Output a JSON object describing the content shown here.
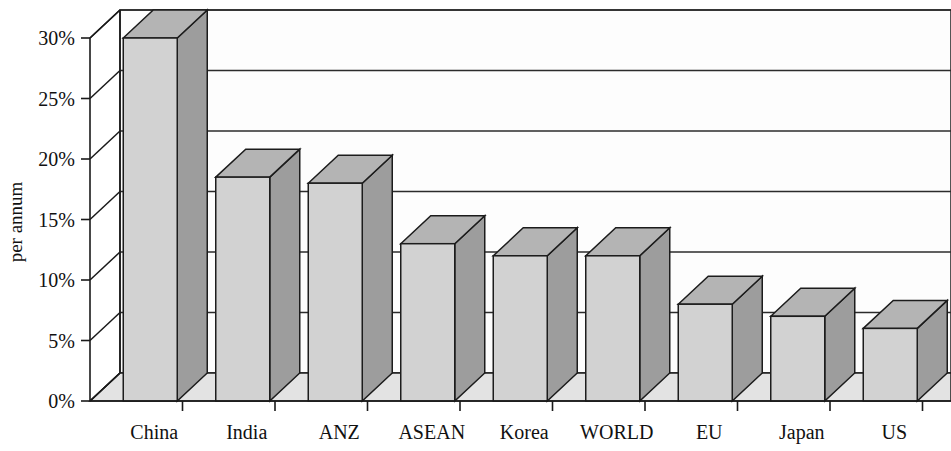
{
  "chart_data": {
    "type": "bar",
    "title": "",
    "subtitle": "",
    "xlabel": "",
    "ylabel": "per annum",
    "categories": [
      "China",
      "India",
      "ANZ",
      "ASEAN",
      "Korea",
      "WORLD",
      "EU",
      "Japan",
      "US"
    ],
    "values": [
      30,
      18.5,
      18,
      13,
      12,
      12,
      8,
      7,
      6
    ],
    "ytick_labels": [
      "0%",
      "5%",
      "10%",
      "15%",
      "20%",
      "25%",
      "30%"
    ],
    "ytick_values": [
      0,
      5,
      10,
      15,
      20,
      25,
      30
    ],
    "ylim": [
      0,
      30
    ],
    "grid": "horizontal",
    "legend": "none",
    "style": "3d-column",
    "colors": {
      "bar_front": "#d2d2d2",
      "bar_top": "#b4b4b4",
      "bar_side": "#9d9d9d",
      "floor": "#e3e3e3",
      "wall": "#fdfdfd",
      "axis": "#1a1a1a",
      "grid": "#2b2b2b",
      "text": "#111111",
      "background": "#ffffff"
    }
  },
  "axis": {
    "y_title": "per annum"
  }
}
